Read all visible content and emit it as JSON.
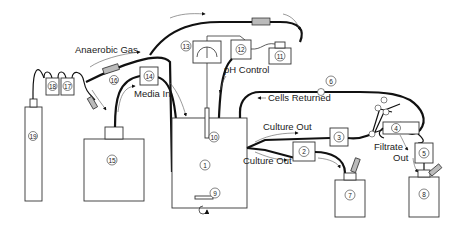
{
  "diagram": {
    "labels": {
      "anaerobic_gas": "Anaerobic Gas",
      "ph_control": "pH Control",
      "media_in": "Media In",
      "cells_returned": "Cells Returned",
      "culture_out_upper": "Culture Out",
      "culture_out_lower": "Culture Out",
      "filtrate": "Filtrate",
      "out": "Out"
    },
    "components": [
      {
        "id": "1",
        "label": "1"
      },
      {
        "id": "2",
        "label": "2"
      },
      {
        "id": "3",
        "label": "3"
      },
      {
        "id": "4",
        "label": "4"
      },
      {
        "id": "5",
        "label": "5"
      },
      {
        "id": "6",
        "label": "6"
      },
      {
        "id": "7",
        "label": "7"
      },
      {
        "id": "8",
        "label": "8"
      },
      {
        "id": "9",
        "label": "9"
      },
      {
        "id": "10",
        "label": "10"
      },
      {
        "id": "11",
        "label": "11"
      },
      {
        "id": "12",
        "label": "12"
      },
      {
        "id": "13",
        "label": "13"
      },
      {
        "id": "14",
        "label": "14"
      },
      {
        "id": "15",
        "label": "15"
      },
      {
        "id": "16",
        "label": "16"
      },
      {
        "id": "17",
        "label": "17"
      },
      {
        "id": "18",
        "label": "18"
      },
      {
        "id": "19",
        "label": "19"
      }
    ]
  }
}
